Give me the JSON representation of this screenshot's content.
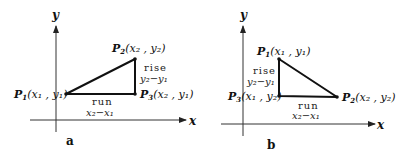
{
  "panels": [
    {
      "id": "a",
      "caption": "a",
      "axes": {
        "x_label": "x",
        "y_label": "y"
      },
      "points": {
        "P1": {
          "name": "P",
          "sub": "1",
          "coords": "(x₁ , y₁)"
        },
        "P2": {
          "name": "P",
          "sub": "2",
          "coords": "(x₂ , y₂)"
        },
        "P3": {
          "name": "P",
          "sub": "3",
          "coords": "(x₂ , y₁)"
        }
      },
      "rise": {
        "label": "rise",
        "expr": "y₂−y₁"
      },
      "run": {
        "label": "run",
        "expr": "x₂−x₁"
      }
    },
    {
      "id": "b",
      "caption": "b",
      "axes": {
        "x_label": "x",
        "y_label": "y"
      },
      "points": {
        "P1": {
          "name": "P",
          "sub": "1",
          "coords": "(x₁ , y₁)"
        },
        "P2": {
          "name": "P",
          "sub": "2",
          "coords": "(x₂ , y₂)"
        },
        "P3": {
          "name": "P",
          "sub": "3",
          "coords": "(x₁ , y₂)"
        }
      },
      "rise": {
        "label": "rise",
        "expr": "y₂−y₁"
      },
      "run": {
        "label": "run",
        "expr": "x₂−x₁"
      }
    }
  ]
}
